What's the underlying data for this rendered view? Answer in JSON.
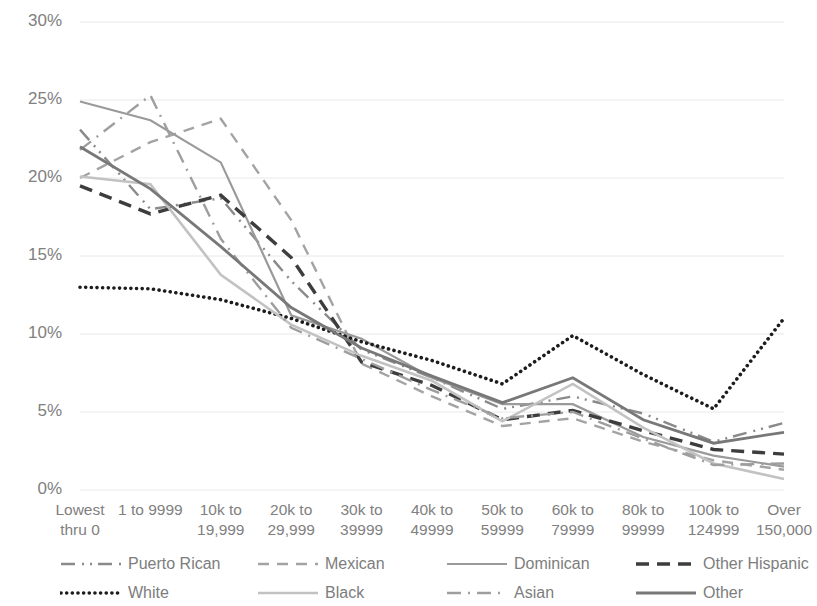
{
  "chart_data": {
    "type": "line",
    "title": "",
    "xlabel": "",
    "ylabel": "",
    "ylim": [
      0,
      30
    ],
    "yticks": [
      "0%",
      "5%",
      "10%",
      "15%",
      "20%",
      "25%",
      "30%"
    ],
    "ytick_values": [
      0,
      5,
      10,
      15,
      20,
      25,
      30
    ],
    "grid": true,
    "legend_position": "bottom",
    "categories": [
      "Lowest\nthru 0",
      "1 to 9999",
      "10k to\n19,999",
      "20k to\n29,999",
      "30k to\n39999",
      "40k to\n49999",
      "50k to\n59999",
      "60k to\n79999",
      "80k to\n99999",
      "100k to\n124999",
      "Over\n150,000"
    ],
    "series": [
      {
        "name": "Puerto Rican",
        "style": "dashdotdot",
        "color": "#8a8a8a",
        "width": 2.4,
        "values": [
          23.1,
          18.0,
          18.7,
          13.4,
          9.0,
          7.2,
          5.2,
          6.0,
          4.9,
          3.1,
          4.3
        ]
      },
      {
        "name": "Mexican",
        "style": "dashed",
        "color": "#a3a3a3",
        "width": 2.4,
        "values": [
          20.0,
          22.3,
          23.8,
          17.3,
          8.1,
          6.0,
          4.1,
          4.6,
          3.1,
          1.9,
          1.3
        ]
      },
      {
        "name": "Dominican",
        "style": "solid",
        "color": "#9a9a9a",
        "width": 2.2,
        "values": [
          24.9,
          23.7,
          21.0,
          11.2,
          9.7,
          7.2,
          5.5,
          5.5,
          3.4,
          2.2,
          1.5
        ]
      },
      {
        "name": "Other Hispanic",
        "style": "dashed-bold",
        "color": "#3d3d3d",
        "width": 3.4,
        "values": [
          19.5,
          17.7,
          18.9,
          14.9,
          8.2,
          6.7,
          4.5,
          5.1,
          3.8,
          2.6,
          2.3
        ]
      },
      {
        "name": "White",
        "style": "dotted",
        "color": "#1c1c1c",
        "width": 3.6,
        "values": [
          13.0,
          12.9,
          12.2,
          11.0,
          9.5,
          8.3,
          6.8,
          9.9,
          7.4,
          5.2,
          11.0
        ]
      },
      {
        "name": "Black",
        "style": "solid-light",
        "color": "#c2c2c2",
        "width": 2.6,
        "values": [
          20.1,
          19.6,
          13.8,
          10.6,
          8.6,
          7.0,
          4.4,
          6.8,
          4.0,
          1.7,
          0.7
        ]
      },
      {
        "name": "Asian",
        "style": "dashdot",
        "color": "#9e9e9e",
        "width": 2.4,
        "values": [
          21.8,
          25.3,
          16.1,
          10.4,
          8.4,
          6.4,
          4.6,
          5.0,
          3.3,
          1.6,
          1.7
        ]
      },
      {
        "name": "Other",
        "style": "solid-dark",
        "color": "#787878",
        "width": 2.8,
        "values": [
          22.0,
          19.3,
          15.6,
          11.7,
          9.1,
          7.3,
          5.6,
          7.2,
          4.5,
          3.0,
          3.7
        ]
      }
    ]
  },
  "legend": {
    "rows": [
      [
        {
          "label": "Puerto Rican",
          "series_index": 0
        },
        {
          "label": "Mexican",
          "series_index": 1
        },
        {
          "label": "Dominican",
          "series_index": 2
        },
        {
          "label": "Other Hispanic",
          "series_index": 3
        }
      ],
      [
        {
          "label": "White",
          "series_index": 4
        },
        {
          "label": "Black",
          "series_index": 5
        },
        {
          "label": "Asian",
          "series_index": 6
        },
        {
          "label": "Other",
          "series_index": 7
        }
      ]
    ]
  },
  "colors": {
    "gridline": "#e8e8e8",
    "tick_text": "#808080",
    "background": "#ffffff"
  }
}
